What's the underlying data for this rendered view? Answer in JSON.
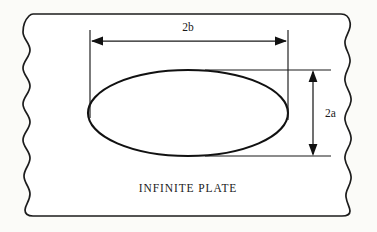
{
  "figure": {
    "type": "engineering-diagram",
    "background_color": "#fbfbf8",
    "line_color": "#1a1a1a",
    "plate_fill": "#ffffff"
  },
  "labels": {
    "width_dimension": "2b",
    "height_dimension": "2a",
    "plate_caption": "INFINITE PLATE"
  },
  "geometry": {
    "plate": {
      "top_edge_y": 14,
      "bottom_edge_y": 216,
      "left_edge_x": 26,
      "right_edge_x": 350,
      "left_edge_style": "wavy-break",
      "right_edge_style": "wavy-break",
      "top_edge_style": "straight",
      "bottom_edge_style": "straight"
    },
    "ellipse": {
      "center_x": 188,
      "center_y": 113,
      "semi_axis_horizontal": 100,
      "semi_axis_vertical": 43
    },
    "width_dimension_line": {
      "y": 41,
      "x_start": 91,
      "x_end": 287,
      "arrowheads": "both-ends",
      "extension_line_x_left": 90,
      "extension_line_x_right": 288,
      "extension_top_y": 30,
      "extension_bottom_y": 118
    },
    "height_dimension_line": {
      "x": 313,
      "y_start": 70,
      "y_end": 156,
      "arrowheads": "both-ends",
      "tick_line_top_y": 70,
      "tick_line_bottom_y": 156,
      "tick_line_x_start": 205,
      "tick_line_x_end": 331
    },
    "caption_position": {
      "x": 188,
      "y": 192
    }
  }
}
